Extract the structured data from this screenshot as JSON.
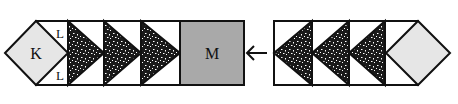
{
  "diagram": {
    "left_unit": {
      "diamond_label": "K",
      "corner_label_top": "L",
      "corner_label_bottom": "L",
      "triangle_count": 3,
      "triangle_direction": "right"
    },
    "center_square": {
      "label": "M"
    },
    "arrow": {
      "direction": "left",
      "glyph": "←"
    },
    "right_unit": {
      "triangle_count": 3,
      "triangle_direction": "left",
      "diamond_label": ""
    },
    "colors": {
      "outline": "#111111",
      "diamond_fill": "#e6e6e6",
      "square_fill": "#a9a9a9",
      "triangle_fill": "#1a1a1a",
      "background": "#ffffff"
    }
  }
}
